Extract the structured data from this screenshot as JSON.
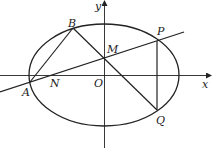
{
  "diagram": {
    "type": "coordinate-geometry",
    "axes": {
      "x_label": "x",
      "y_label": "y",
      "origin_label": "O"
    },
    "points": {
      "A": "A",
      "B": "B",
      "M": "M",
      "N": "N",
      "P": "P",
      "Q": "Q"
    },
    "segments": [
      "AB",
      "BQ",
      "PQ"
    ],
    "lines": [
      "line through A, N, M, P"
    ],
    "colors": {
      "stroke": "#222222",
      "background": "#ffffff"
    }
  }
}
